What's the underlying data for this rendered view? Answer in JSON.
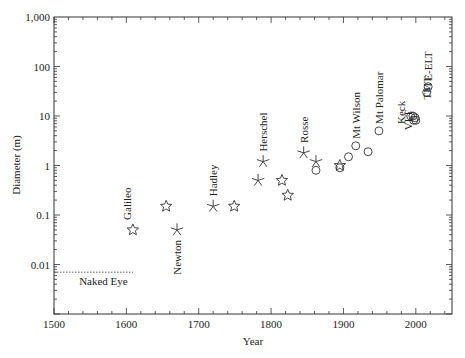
{
  "chart_data": {
    "type": "scatter",
    "title": "",
    "xlabel": "Year",
    "ylabel": "Diameter (m)",
    "xlim": [
      1500,
      2050
    ],
    "ylim": [
      0.001,
      1000
    ],
    "yscale": "log",
    "grid": false,
    "x_ticks": [
      1500,
      1600,
      1700,
      1800,
      1900,
      2000
    ],
    "x_tick_labels": [
      "1500",
      "1600",
      "1700",
      "1800",
      "1900",
      "2000"
    ],
    "y_ticks": [
      0.01,
      0.1,
      1,
      10,
      100,
      1000
    ],
    "y_tick_labels": [
      "0.01",
      "0.1",
      "1",
      "10",
      "100",
      "1,000"
    ],
    "marker_legend": {
      "star": "refracting telescope",
      "asterisk": "speculum-metal reflector",
      "circle": "glass-mirror reflector"
    },
    "series": [
      {
        "name": "star",
        "points": [
          {
            "x": 1609,
            "y": 0.05,
            "label": "Galileo"
          },
          {
            "x": 1655,
            "y": 0.15
          },
          {
            "x": 1749,
            "y": 0.15
          },
          {
            "x": 1815,
            "y": 0.5
          },
          {
            "x": 1823,
            "y": 0.25
          },
          {
            "x": 1895,
            "y": 1.0
          }
        ]
      },
      {
        "name": "asterisk",
        "points": [
          {
            "x": 1670,
            "y": 0.05,
            "label": "Newton"
          },
          {
            "x": 1720,
            "y": 0.15,
            "label": "Hadley"
          },
          {
            "x": 1782,
            "y": 0.5
          },
          {
            "x": 1789,
            "y": 1.2,
            "label": "Herschel"
          },
          {
            "x": 1845,
            "y": 1.8,
            "label": "Rosse"
          },
          {
            "x": 1862,
            "y": 1.2
          }
        ]
      },
      {
        "name": "circle",
        "points": [
          {
            "x": 1862,
            "y": 0.8
          },
          {
            "x": 1895,
            "y": 0.9
          },
          {
            "x": 1907,
            "y": 1.5
          },
          {
            "x": 1917,
            "y": 2.5,
            "label": "Mt Wilson"
          },
          {
            "x": 1934,
            "y": 1.9
          },
          {
            "x": 1949,
            "y": 5.0,
            "label": "Mt Palomar"
          },
          {
            "x": 1993,
            "y": 10,
            "label": "Keck"
          },
          {
            "x": 1996,
            "y": 10
          },
          {
            "x": 1997,
            "y": 8.2,
            "label": "VLT"
          },
          {
            "x": 2000,
            "y": 8.2
          },
          {
            "x": 1999,
            "y": 9.2
          },
          {
            "x": 2015,
            "y": 30,
            "label": "TMT"
          },
          {
            "x": 2017,
            "y": 39,
            "label": "E-ELT"
          }
        ]
      }
    ],
    "annotations": [
      {
        "text": "Naked Eye",
        "type": "dotted-line",
        "y": 0.007,
        "x_from": 1500,
        "x_to": 1609
      }
    ]
  }
}
